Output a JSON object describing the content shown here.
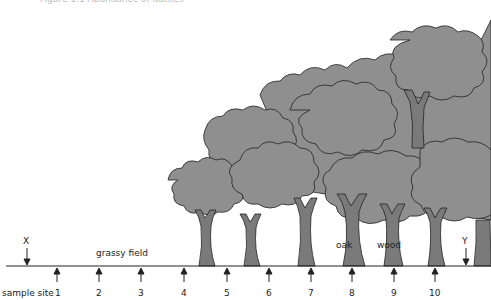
{
  "caption": "Figure 1.1 Abundance of daisies",
  "labels": {
    "grassy_field": "grassy field",
    "oak": "oak",
    "wood": "wood",
    "sample_site": "sample site",
    "x_marker": "X",
    "y_marker": "Y"
  },
  "sites": [
    {
      "num": "1",
      "x": 57
    },
    {
      "num": "2",
      "x": 99
    },
    {
      "num": "3",
      "x": 141
    },
    {
      "num": "4",
      "x": 184
    },
    {
      "num": "5",
      "x": 227
    },
    {
      "num": "6",
      "x": 269
    },
    {
      "num": "7",
      "x": 311
    },
    {
      "num": "8",
      "x": 352
    },
    {
      "num": "9",
      "x": 394
    },
    {
      "num": "10",
      "x": 435
    }
  ],
  "colors": {
    "foliage": "#8f8f8f",
    "trunk": "#7a7a7a",
    "outline": "#222222"
  }
}
